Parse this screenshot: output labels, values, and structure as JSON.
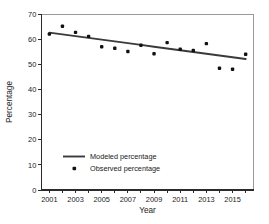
{
  "chart_data": {
    "type": "scatter",
    "title": "",
    "xlabel": "Year",
    "ylabel": "Percentage",
    "xlim": [
      2000.4,
      2016.6
    ],
    "ylim": [
      0,
      70
    ],
    "grid": false,
    "legend_position": "lower-left-inside",
    "x_tick_labels": [
      "2001",
      "2003",
      "2005",
      "2007",
      "2009",
      "2011",
      "2013",
      "2015"
    ],
    "x_tick_values": [
      2001,
      2003,
      2005,
      2007,
      2009,
      2011,
      2013,
      2015
    ],
    "x_minor_ticks": [
      2002,
      2004,
      2006,
      2008,
      2010,
      2012,
      2014,
      2016
    ],
    "y_tick_labels": [
      "0",
      "10",
      "20",
      "30",
      "40",
      "50",
      "60",
      "70"
    ],
    "y_tick_values": [
      0,
      10,
      20,
      30,
      40,
      50,
      60,
      70
    ],
    "x": [
      2001,
      2002,
      2003,
      2004,
      2005,
      2006,
      2007,
      2008,
      2009,
      2010,
      2011,
      2012,
      2013,
      2014,
      2015,
      2016
    ],
    "series": [
      {
        "name": "Observed percentage",
        "marker": "square-dot",
        "color": "#111111",
        "values": [
          62.0,
          65.1,
          62.7,
          61.1,
          57.0,
          56.4,
          55.1,
          57.6,
          54.2,
          58.6,
          56.0,
          55.5,
          58.2,
          48.4,
          48.0,
          54.0
        ]
      },
      {
        "name": "Modeled percentage",
        "marker": "line",
        "color": "#3a3a3a",
        "values": [
          62.6,
          61.9,
          61.2,
          60.5,
          59.8,
          59.1,
          58.4,
          57.7,
          57.0,
          56.3,
          55.6,
          54.9,
          54.2,
          53.5,
          52.8,
          52.1
        ]
      }
    ],
    "legend_entries": [
      {
        "label": "Modeled percentage",
        "marker": "line",
        "color": "#3a3a3a"
      },
      {
        "label": "Observed percentage",
        "marker": "square-dot",
        "color": "#111111"
      }
    ]
  }
}
